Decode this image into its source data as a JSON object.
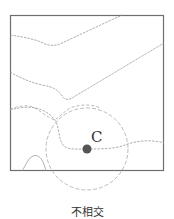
{
  "diagram": {
    "title": "不相交",
    "point_label": "C",
    "colors": {
      "frame": "#6e6e6e",
      "contour": "#9a9a9a",
      "circle": "#a8a8a8",
      "point": "#555555",
      "background": "#ffffff"
    },
    "frame": {
      "x": 10,
      "y": 15,
      "width": 154,
      "height": 156
    },
    "circle": {
      "cx": 87,
      "cy": 149,
      "r": 41
    },
    "point": {
      "cx": 87,
      "cy": 149,
      "r": 4.5
    },
    "contours": [
      "upper-contour-line",
      "second-contour-line",
      "middle-dashed-contour",
      "lower-dashed-contour-through-C",
      "bottom-left-hump"
    ]
  }
}
